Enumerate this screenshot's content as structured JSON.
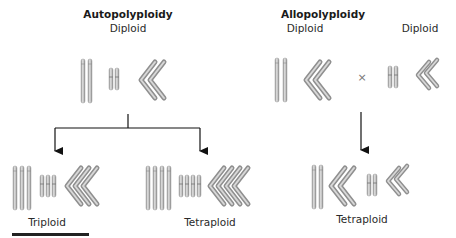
{
  "autopolyploidy": {
    "title": "Autopolyploidy",
    "parent_label": "Diploid",
    "offspring": [
      {
        "label": "Triploid",
        "copies": 3
      },
      {
        "label": "Tetraploid",
        "copies": 4
      }
    ]
  },
  "allopolyploidy": {
    "title": "Allopolyploidy",
    "parent_left_label": "Diploid",
    "parent_right_label": "Diploid",
    "cross_symbol": "×",
    "offspring": {
      "label": "Tetraploid",
      "copies": 4
    }
  },
  "colors": {
    "chromosome_fill": "#b8b8b8",
    "chromosome_highlight": "#e4e4e4",
    "chromosome_edge": "#8c8c8c",
    "arrow": "#111111",
    "underline_bar": "#222222"
  }
}
